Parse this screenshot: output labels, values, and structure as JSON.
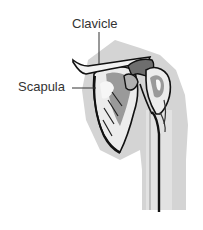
{
  "diagram": {
    "labels": [
      {
        "id": "clavicle",
        "text": "Clavicle"
      },
      {
        "id": "scapula",
        "text": "Scapula"
      }
    ]
  },
  "colors": {
    "background": "#ffffff",
    "silhouette": "#d4d4d4",
    "bone_light": "#ececec",
    "bone_mid": "#9a9a9a",
    "bone_dark": "#6e6e6e",
    "outline": "#111111",
    "label_text": "#333333",
    "leader_line": "#333333"
  }
}
